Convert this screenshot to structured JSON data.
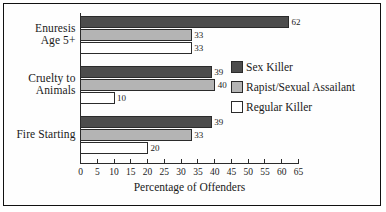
{
  "chart_data": {
    "type": "bar",
    "orientation": "horizontal",
    "title": "",
    "xlabel": "Percentage of Offenders",
    "ylabel": "",
    "xlim": [
      0,
      65
    ],
    "xticks": [
      0,
      5,
      10,
      15,
      20,
      25,
      30,
      35,
      40,
      45,
      50,
      55,
      60,
      65
    ],
    "xtick_labels": [
      "0",
      "5",
      "10",
      "15",
      "20",
      "25",
      "30",
      "35",
      "40",
      "45",
      "50",
      "55",
      "60",
      "65"
    ],
    "grid": false,
    "legend_position": "right",
    "categories": [
      "Enuresis\nAge 5+",
      "Cruelty to\nAnimals",
      "Fire Starting"
    ],
    "category_lines": [
      [
        "Enuresis",
        "Age 5+"
      ],
      [
        "Cruelty to",
        "Animals"
      ],
      [
        "Fire Starting"
      ]
    ],
    "series": [
      {
        "name": "Sex Killer",
        "color": "#4d4d4d",
        "values": [
          62,
          39,
          39
        ]
      },
      {
        "name": "Rapist/Sexual Assailant",
        "color": "#b4b4b4",
        "values": [
          33,
          40,
          33
        ]
      },
      {
        "name": "Regular Killer",
        "color": "#ffffff",
        "values": [
          33,
          10,
          20
        ]
      }
    ],
    "data_labels": [
      [
        "62",
        "33",
        "33"
      ],
      [
        "39",
        "40",
        "10"
      ],
      [
        "39",
        "33",
        "20"
      ]
    ]
  },
  "legend": {
    "items": [
      {
        "label": "Sex Killer",
        "color": "#4d4d4d"
      },
      {
        "label": "Rapist/Sexual Assailant",
        "color": "#b4b4b4"
      },
      {
        "label": "Regular Killer",
        "color": "#ffffff"
      }
    ]
  },
  "axis": {
    "x_title": "Percentage of Offenders"
  }
}
